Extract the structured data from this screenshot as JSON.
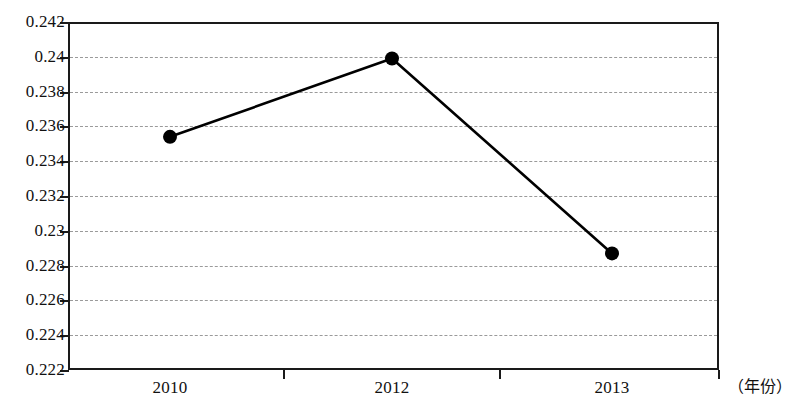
{
  "chart_data": {
    "type": "line",
    "title": "",
    "subtitle": "",
    "xlabel": "（年份）",
    "ylabel": "",
    "categories": [
      "2010",
      "2012",
      "2013"
    ],
    "x": [
      2010,
      2012,
      2013
    ],
    "values": [
      0.2354,
      0.2399,
      0.2287
    ],
    "series": [
      {
        "name": "series-1",
        "values": [
          0.2354,
          0.2399,
          0.2287
        ],
        "marker": "filled-circle",
        "color": "#000000"
      }
    ],
    "ylim": [
      0.222,
      0.242
    ],
    "ytick_step": 0.002,
    "ytick_labels": [
      "0.242",
      "0.24",
      "0.238",
      "0.236",
      "0.234",
      "0.232",
      "0.23",
      "0.228",
      "0.226",
      "0.224",
      "0.222"
    ],
    "ytick_values": [
      0.242,
      0.24,
      0.238,
      0.236,
      0.234,
      0.232,
      0.23,
      0.228,
      0.226,
      0.224,
      0.222
    ],
    "xtick_labels": [
      "2010",
      "2012",
      "2013"
    ],
    "grid": true,
    "grid_style": "dashed-horizontal",
    "legend": "none",
    "annotations": []
  },
  "axis": {
    "x_title": "（年份）"
  }
}
